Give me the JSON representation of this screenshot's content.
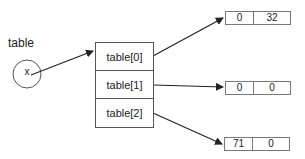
{
  "variable": {
    "label": "table",
    "value_symbol": "x"
  },
  "table_array": {
    "cells": [
      "table[0]",
      "table[1]",
      "table[2]"
    ]
  },
  "sub_arrays": [
    {
      "values": [
        "0",
        "32"
      ]
    },
    {
      "values": [
        "0",
        "0"
      ]
    },
    {
      "values": [
        "71",
        "0"
      ]
    }
  ],
  "colors": {
    "stroke": "#333333",
    "background": "#ffffff"
  }
}
